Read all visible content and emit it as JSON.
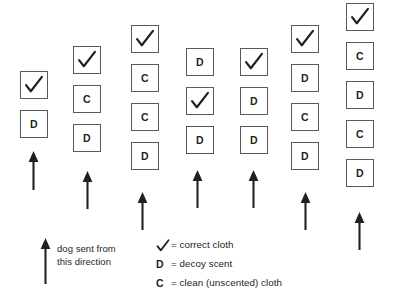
{
  "figure": {
    "box_outline_color": "#58595b",
    "ink_color": "#231f20",
    "background_color": "#ffffff"
  },
  "columns": [
    {
      "id": "column-1",
      "x": 20,
      "top": 71,
      "items": [
        {
          "symbol": "check",
          "label": "✓"
        },
        {
          "symbol": "letter",
          "label": "D"
        }
      ],
      "arrow": {
        "x": 33,
        "y_bottom": 190,
        "y_top": 151
      }
    },
    {
      "id": "column-2",
      "x": 73,
      "top": 46,
      "items": [
        {
          "symbol": "check",
          "label": "✓"
        },
        {
          "symbol": "letter",
          "label": "C"
        },
        {
          "symbol": "letter",
          "label": "D"
        }
      ],
      "arrow": {
        "x": 87,
        "y_bottom": 209,
        "y_top": 171
      }
    },
    {
      "id": "column-3",
      "x": 131,
      "top": 25,
      "items": [
        {
          "symbol": "check",
          "label": "✓"
        },
        {
          "symbol": "letter",
          "label": "C"
        },
        {
          "symbol": "letter",
          "label": "C"
        },
        {
          "symbol": "letter",
          "label": "D"
        }
      ],
      "arrow": {
        "x": 142,
        "y_bottom": 230,
        "y_top": 192
      }
    },
    {
      "id": "column-4",
      "x": 186,
      "top": 48,
      "items": [
        {
          "symbol": "letter",
          "label": "D"
        },
        {
          "symbol": "check",
          "label": "✓"
        },
        {
          "symbol": "letter",
          "label": "D"
        }
      ],
      "arrow": {
        "x": 197,
        "y_bottom": 208,
        "y_top": 170
      }
    },
    {
      "id": "column-5",
      "x": 240,
      "top": 48,
      "items": [
        {
          "symbol": "check",
          "label": "✓"
        },
        {
          "symbol": "letter",
          "label": "D"
        },
        {
          "symbol": "letter",
          "label": "D"
        }
      ],
      "arrow": {
        "x": 253,
        "y_bottom": 208,
        "y_top": 170
      }
    },
    {
      "id": "column-6",
      "x": 291,
      "top": 25,
      "items": [
        {
          "symbol": "check",
          "label": "✓"
        },
        {
          "symbol": "letter",
          "label": "D"
        },
        {
          "symbol": "letter",
          "label": "C"
        },
        {
          "symbol": "letter",
          "label": "D"
        }
      ],
      "arrow": {
        "x": 305,
        "y_bottom": 230,
        "y_top": 192
      }
    },
    {
      "id": "column-7",
      "x": 346,
      "top": 3,
      "items": [
        {
          "symbol": "check",
          "label": "✓"
        },
        {
          "symbol": "letter",
          "label": "C"
        },
        {
          "symbol": "letter",
          "label": "D"
        },
        {
          "symbol": "letter",
          "label": "C"
        },
        {
          "symbol": "letter",
          "label": "D"
        }
      ],
      "arrow": {
        "x": 359,
        "y_bottom": 250,
        "y_top": 212
      }
    }
  ],
  "dog_note": {
    "text": "dog sent from\nthis direction",
    "arrow": {
      "x": 45,
      "y_bottom": 284,
      "y_top": 238
    }
  },
  "legend": {
    "rows": [
      {
        "key": "✓",
        "key_type": "check",
        "text": "= correct cloth"
      },
      {
        "key": "D",
        "key_type": "letter",
        "text": "= decoy scent"
      },
      {
        "key": "C",
        "key_type": "letter",
        "text": "= clean (unscented) cloth"
      }
    ]
  }
}
